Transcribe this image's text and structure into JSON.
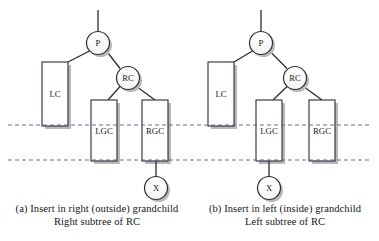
{
  "figure": {
    "background": "#ffffff",
    "stroke_color": "#2b2b3a",
    "shadow_color": "#b9b9b9",
    "dashed_color": "#5a5a8c",
    "panels": [
      {
        "id": "a",
        "caption_line1": "(a) Insert in right (outside) grandchild",
        "caption_line2": "Right subtree of RC",
        "nodes": [
          {
            "name": "node-p",
            "label": "P",
            "cx": 98,
            "cy": 43,
            "r": 11.5
          },
          {
            "name": "node-rc",
            "label": "RC",
            "cx": 128,
            "cy": 78,
            "r": 11.5
          },
          {
            "name": "node-x",
            "label": "X",
            "cx": 156,
            "cy": 188,
            "r": 11.5
          }
        ],
        "boxes": [
          {
            "name": "subtree-lc",
            "label": "LC",
            "x": 42,
            "y": 62,
            "w": 26,
            "h": 64
          },
          {
            "name": "subtree-lgc",
            "label": "LGC",
            "x": 91,
            "y": 100,
            "w": 26,
            "h": 61
          },
          {
            "name": "subtree-rgc",
            "label": "RGC",
            "x": 142,
            "y": 100,
            "w": 26,
            "h": 61
          }
        ],
        "edges": [
          {
            "name": "edge-root-stub",
            "x1": 98,
            "y1": 10,
            "x2": 98,
            "y2": 31.5
          },
          {
            "name": "edge-p-lc",
            "x1": 89.5,
            "y1": 51,
            "x2": 68,
            "y2": 62
          },
          {
            "name": "edge-p-rc",
            "x1": 106.5,
            "y1": 51,
            "x2": 120,
            "y2": 68.5
          },
          {
            "name": "edge-rc-lgc",
            "x1": 120,
            "y1": 86,
            "x2": 108,
            "y2": 100
          },
          {
            "name": "edge-rc-rgc",
            "x1": 136.5,
            "y1": 86,
            "x2": 155,
            "y2": 100
          },
          {
            "name": "edge-rgc-x",
            "x1": 156,
            "y1": 161,
            "x2": 156,
            "y2": 176.5
          }
        ]
      },
      {
        "id": "b",
        "caption_line1": "(b) Insert in left (inside) grandchild",
        "caption_line2": "Left subtree of RC",
        "nodes": [
          {
            "name": "node-p",
            "label": "P",
            "cx": 261,
            "cy": 43,
            "r": 11.5
          },
          {
            "name": "node-rc",
            "label": "RC",
            "cx": 295,
            "cy": 78,
            "r": 11.5
          },
          {
            "name": "node-x",
            "label": "X",
            "cx": 269,
            "cy": 188,
            "r": 11.5
          }
        ],
        "boxes": [
          {
            "name": "subtree-lc",
            "label": "LC",
            "x": 208,
            "y": 62,
            "w": 26,
            "h": 64
          },
          {
            "name": "subtree-lgc",
            "label": "LGC",
            "x": 256,
            "y": 100,
            "w": 26,
            "h": 61
          },
          {
            "name": "subtree-rgc",
            "label": "RGC",
            "x": 309,
            "y": 100,
            "w": 26,
            "h": 61
          }
        ],
        "edges": [
          {
            "name": "edge-root-stub",
            "x1": 261,
            "y1": 10,
            "x2": 261,
            "y2": 31.5
          },
          {
            "name": "edge-p-lc",
            "x1": 252.5,
            "y1": 51,
            "x2": 234,
            "y2": 62
          },
          {
            "name": "edge-p-rc",
            "x1": 269.5,
            "y1": 51,
            "x2": 287,
            "y2": 68.5
          },
          {
            "name": "edge-rc-lgc",
            "x1": 287,
            "y1": 86,
            "x2": 273,
            "y2": 100
          },
          {
            "name": "edge-rc-rgc",
            "x1": 303.5,
            "y1": 86,
            "x2": 322,
            "y2": 100
          },
          {
            "name": "edge-lgc-x",
            "x1": 269,
            "y1": 161,
            "x2": 269,
            "y2": 176.5
          }
        ]
      }
    ],
    "dashed_lines": [
      {
        "name": "dashed-line-upper",
        "y": 125,
        "x1": 8,
        "x2": 372
      },
      {
        "name": "dashed-line-lower",
        "y": 160,
        "x1": 8,
        "x2": 372
      }
    ]
  }
}
